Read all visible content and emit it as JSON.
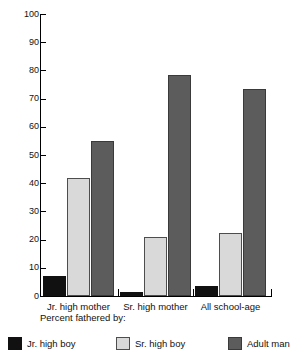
{
  "chart_data": {
    "type": "bar",
    "title": "",
    "xlabel": "Percent fathered by:",
    "ylabel": "",
    "ylim": [
      0,
      100
    ],
    "ytick_labels": [
      "100",
      "90",
      "80",
      "70",
      "60",
      "50",
      "40",
      "30",
      "20",
      "10",
      "0"
    ],
    "ytick_values": [
      100,
      90,
      80,
      70,
      60,
      50,
      40,
      30,
      20,
      10,
      0
    ],
    "grid": false,
    "legend_position": "bottom",
    "categories": [
      "Jr. high mother",
      "Sr. high mother",
      "All school-age"
    ],
    "series": [
      {
        "name": "Jr. high boy",
        "color": "#111111",
        "values": [
          7,
          1.5,
          3.5
        ]
      },
      {
        "name": "Sr. high boy",
        "color": "#d9d9d9",
        "values": [
          42,
          21,
          22.5
        ]
      },
      {
        "name": "Adult man",
        "color": "#5c5c5c",
        "values": [
          55,
          78.5,
          73.5
        ]
      }
    ]
  },
  "caption": "Percent fathered by:"
}
